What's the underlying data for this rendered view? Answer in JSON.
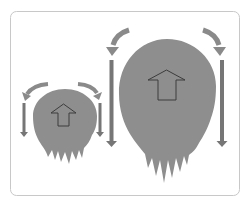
{
  "diagram": {
    "title": "",
    "colors": {
      "background": "#ffffff",
      "frame_border": "#c8c8c8",
      "blob_fill": "#8e8e8e",
      "vertical_arrow": "#767676",
      "curved_arrow": "#8a8a8a",
      "up_arrow_fill": "#8e8e8e",
      "up_arrow_stroke": "#3c3c3c"
    },
    "figures": [
      {
        "name": "small-blob",
        "size": "small",
        "icons": [
          "up-arrow-outline",
          "curved-arrow-left",
          "curved-arrow-right",
          "down-arrow-left",
          "down-arrow-right"
        ]
      },
      {
        "name": "large-blob",
        "size": "large",
        "icons": [
          "up-arrow-outline",
          "curved-arrow-left",
          "curved-arrow-right",
          "down-arrow-left",
          "down-arrow-right"
        ]
      }
    ]
  }
}
